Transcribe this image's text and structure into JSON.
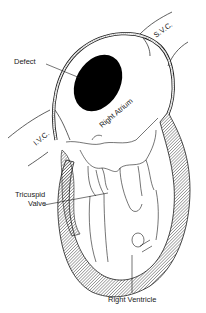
{
  "diagram": {
    "labels": {
      "defect": "Defect",
      "svc": "S.V.C.",
      "ivc": "I.V.C.",
      "right_atrium": "Right Atrium",
      "tricuspid_line1": "Tricuspid",
      "tricuspid_line2": "Valve",
      "right_ventricle": "Right Ventricle"
    },
    "colors": {
      "ink": "#1a1a1a",
      "background": "#ffffff",
      "defect_fill": "#000000",
      "hatch": "#555555"
    }
  }
}
